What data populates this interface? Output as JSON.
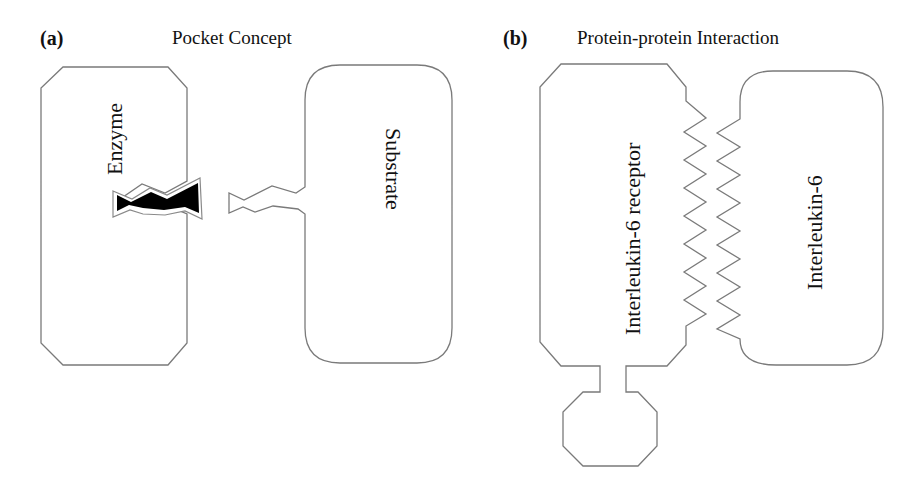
{
  "panel_a": {
    "label": "(a)",
    "title": "Pocket Concept",
    "enzyme_label": "Enzyme",
    "substrate_label": "Substrate"
  },
  "panel_b": {
    "label": "(b)",
    "title": "Protein-protein Interaction",
    "receptor_label": "Interleukin-6 receptor",
    "ligand_label": "Interleukin-6"
  },
  "colors": {
    "outline": "#7a7a7a",
    "ligand_fill": "#000000",
    "text": "#111111",
    "background": "#ffffff"
  }
}
